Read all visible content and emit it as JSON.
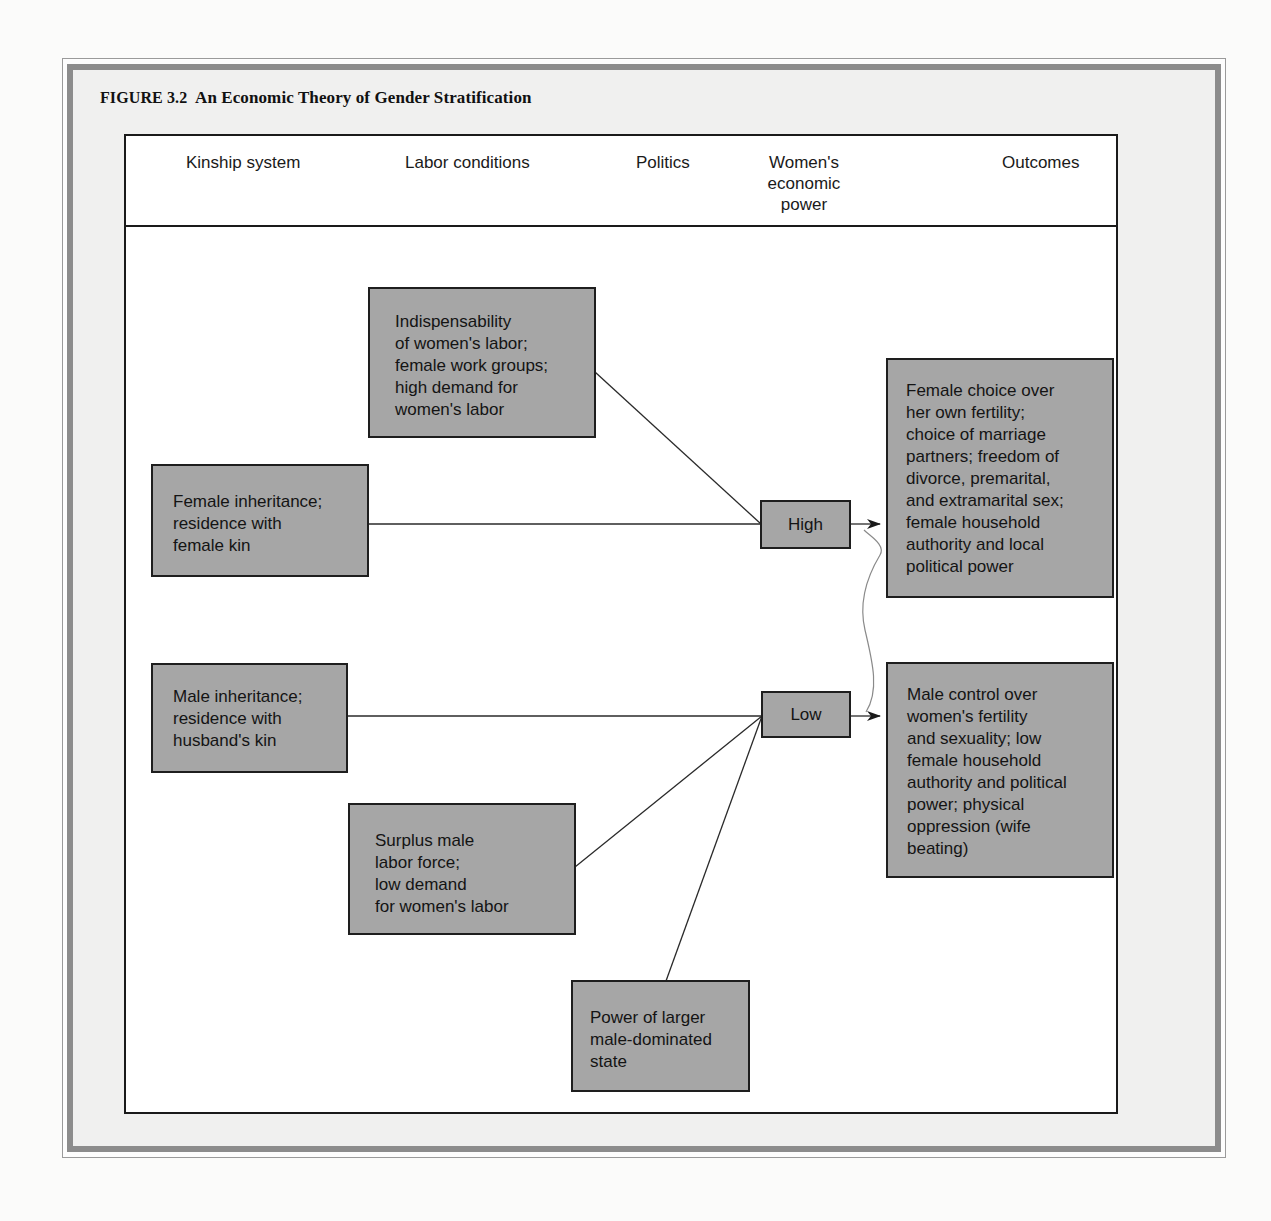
{
  "figure": {
    "label": "FIGURE 3.2",
    "title": "An Economic Theory of Gender Stratification"
  },
  "columns": [
    {
      "label": "Kinship system"
    },
    {
      "label": "Labor conditions"
    },
    {
      "label": "Politics"
    },
    {
      "label": "Women's\neconomic\npower"
    },
    {
      "label": "Outcomes"
    }
  ],
  "nodes": {
    "indispensability": {
      "text": "Indispensability\nof women's labor;\nfemale work groups;\nhigh demand for\nwomen's labor",
      "column": "Labor conditions"
    },
    "female_inheritance": {
      "text": "Female inheritance;\nresidence with\nfemale kin",
      "column": "Kinship system"
    },
    "high": {
      "text": "High",
      "column": "Women's economic power"
    },
    "female_choice": {
      "text": "Female choice over\nher own fertility;\nchoice of marriage\npartners; freedom of\ndivorce, premarital,\nand extramarital sex;\nfemale household\nauthority and local\npolitical power",
      "column": "Outcomes"
    },
    "male_inheritance": {
      "text": "Male inheritance;\nresidence with\nhusband's kin",
      "column": "Kinship system"
    },
    "low": {
      "text": "Low",
      "column": "Women's economic power"
    },
    "male_control": {
      "text": "Male control over\nwomen's fertility\nand sexuality; low\nfemale household\nauthority and political\npower; physical\noppression (wife\nbeating)",
      "column": "Outcomes"
    },
    "surplus_male_labor": {
      "text": "Surplus male\nlabor force;\nlow demand\nfor women's labor",
      "column": "Labor conditions"
    },
    "state_power": {
      "text": "Power of larger\nmale-dominated\nstate",
      "column": "Politics"
    }
  },
  "edges": [
    {
      "from": "indispensability",
      "to": "high",
      "arrow": false
    },
    {
      "from": "female_inheritance",
      "to": "high",
      "arrow": false
    },
    {
      "from": "high",
      "to": "female_choice",
      "arrow": true
    },
    {
      "from": "male_inheritance",
      "to": "low",
      "arrow": false
    },
    {
      "from": "surplus_male_labor",
      "to": "low",
      "arrow": false
    },
    {
      "from": "state_power",
      "to": "low",
      "arrow": false
    },
    {
      "from": "low",
      "to": "male_control",
      "arrow": true
    },
    {
      "from": "low",
      "to": "high",
      "style": "faint wavy hand-drawn mark",
      "arrow": false
    }
  ],
  "colors": {
    "node_fill": "#a6a6a6",
    "node_border": "#1e1e1e",
    "frame_band": "#8c8c8c",
    "frame_fill": "#f0f0ef",
    "diagram_bg": "#ffffff",
    "line": "#2a2a2a"
  }
}
